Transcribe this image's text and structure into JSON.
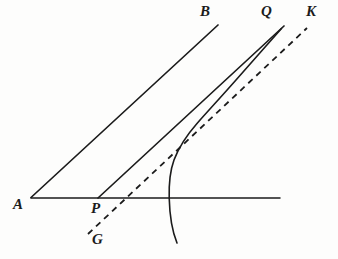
{
  "figure": {
    "background_color": "#fdfdfc",
    "ink_color": "#1b1b1b",
    "labels": {
      "a": "A",
      "b": "B",
      "p": "P",
      "q": "Q",
      "k": "K",
      "g": "G"
    },
    "label_positions": [
      {
        "name": "A",
        "x": 13,
        "y": 197
      },
      {
        "name": "P",
        "x": 91,
        "y": 201
      },
      {
        "name": "G",
        "x": 92,
        "y": 232
      },
      {
        "name": "B",
        "x": 200,
        "y": 4
      },
      {
        "name": "Q",
        "x": 261,
        "y": 4
      },
      {
        "name": "K",
        "x": 306,
        "y": 4
      }
    ],
    "elements": [
      {
        "name": "baseline-ak",
        "kind": "segment",
        "style": "solid",
        "from": {
          "x": 31,
          "y": 198
        },
        "to": {
          "x": 280,
          "y": 198
        }
      },
      {
        "name": "ray-ab",
        "kind": "segment",
        "style": "solid",
        "from": {
          "x": 31,
          "y": 197
        },
        "to": {
          "x": 218,
          "y": 25
        }
      },
      {
        "name": "ray-pq",
        "kind": "segment",
        "style": "solid",
        "from": {
          "x": 98,
          "y": 198
        },
        "to": {
          "x": 284,
          "y": 26
        }
      },
      {
        "name": "dashed-line-gk",
        "kind": "segment",
        "style": "dashed",
        "dash_length": 6,
        "gap_length": 5,
        "from": {
          "x": 88,
          "y": 234
        },
        "to": {
          "x": 307,
          "y": 28
        }
      },
      {
        "name": "asymptotic-curve",
        "kind": "curve",
        "style": "solid",
        "points": [
          {
            "x": 177,
            "y": 243
          },
          {
            "x": 171,
            "y": 218
          },
          {
            "x": 169,
            "y": 198
          },
          {
            "x": 169,
            "y": 180
          },
          {
            "x": 173,
            "y": 160
          },
          {
            "x": 182,
            "y": 142
          },
          {
            "x": 196,
            "y": 124
          },
          {
            "x": 214,
            "y": 104
          },
          {
            "x": 236,
            "y": 80
          },
          {
            "x": 259,
            "y": 55
          },
          {
            "x": 280,
            "y": 30
          }
        ]
      }
    ]
  }
}
